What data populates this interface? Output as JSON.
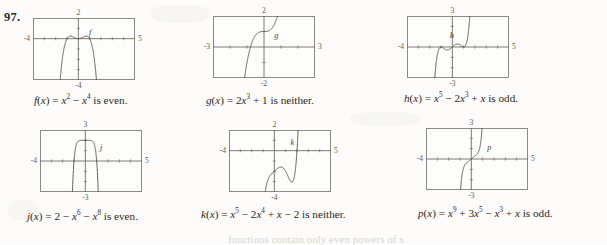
{
  "problem": {
    "number": "97."
  },
  "footer": {
    "text": "functions contain only even powers of x"
  },
  "graphs": [
    {
      "id": "graph-f",
      "curve_label": "f",
      "caption_html": "<i>f</i>(<i>x</i>) = <i>x</i><sup>2</sup> &minus; <i>x</i><sup>4</sup> is even.",
      "caption_text": "f(x) = x2 - x4 is even.",
      "window": {
        "xmin": -4,
        "xmax": 5,
        "ymin": -4,
        "ymax": 2
      },
      "labels": {
        "top": "2",
        "bottom": "-4",
        "left": "-4",
        "right": "5"
      },
      "expression": "x^2 - x^4",
      "parity": "even"
    },
    {
      "id": "graph-g",
      "curve_label": "g",
      "caption_html": "<i>g</i>(<i>x</i>) = 2<i>x</i><sup>3</sup> + 1 is neither.",
      "caption_text": "g(x) = 2x3 + 1 is neither.",
      "window": {
        "xmin": -3,
        "xmax": 3,
        "ymin": -2,
        "ymax": 2
      },
      "labels": {
        "top": "2",
        "bottom": "-2",
        "left": "-3",
        "right": "3"
      },
      "expression": "2x^3 + 1",
      "parity": "neither"
    },
    {
      "id": "graph-h",
      "curve_label": "h",
      "caption_html": "<i>h</i>(<i>x</i>) = <i>x</i><sup>5</sup> &minus; 2<i>x</i><sup>3</sup> + <i>x</i> is odd.",
      "caption_text": "h(x) = x5 - 2x3 + x is odd.",
      "window": {
        "xmin": -4,
        "xmax": 5,
        "ymin": -3,
        "ymax": 3
      },
      "labels": {
        "top": "3",
        "bottom": "-3",
        "left": "-4",
        "right": "5"
      },
      "expression": "x^5 - 2x^3 + x",
      "parity": "odd"
    },
    {
      "id": "graph-j",
      "curve_label": "j",
      "caption_html": "<i>j</i>(<i>x</i>) = 2 &minus; <i>x</i><sup>6</sup> &minus; <i>x</i><sup>8</sup> is even.",
      "caption_text": "j(x) = 2 - x6 - x8 is even.",
      "window": {
        "xmin": -4,
        "xmax": 5,
        "ymin": -3,
        "ymax": 3
      },
      "labels": {
        "top": "3",
        "bottom": "-3",
        "left": "-4",
        "right": "5"
      },
      "expression": "2 - x^6 - x^8",
      "parity": "even"
    },
    {
      "id": "graph-k",
      "curve_label": "k",
      "caption_html": "<i>k</i>(<i>x</i>) = <i>x</i><sup>5</sup> &minus; 2<i>x</i><sup>4</sup> + <i>x</i> &minus; 2 is neither.",
      "caption_text": "k(x) = x5 - 2x4 + x - 2 is neither.",
      "window": {
        "xmin": -4,
        "xmax": 5,
        "ymin": -4,
        "ymax": 2
      },
      "labels": {
        "top": "2",
        "bottom": "-4",
        "left": "-4",
        "right": "5"
      },
      "expression": "x^5 - 2x^4 + x - 2",
      "parity": "neither"
    },
    {
      "id": "graph-p",
      "curve_label": "p",
      "caption_html": "<i>p</i>(<i>x</i>) = <i>x</i><sup>9</sup> + 3<i>x</i><sup>5</sup> &minus; <i>x</i><sup>3</sup> + <i>x</i> is odd.",
      "caption_text": "p(x) = x9 + 3x5 - x3 + x is odd.",
      "window": {
        "xmin": -4,
        "xmax": 5,
        "ymin": -3,
        "ymax": 3
      },
      "labels": {
        "top": "3",
        "bottom": "-3",
        "left": "-4",
        "right": "5"
      },
      "expression": "x^9 + 3x^5 - x^3 + x",
      "parity": "odd"
    }
  ],
  "chart_data": [
    {
      "type": "line",
      "title": "f(x) = x^2 - x^4 is even.",
      "xlabel": "x",
      "ylabel": "y",
      "xlim": [
        -4,
        5
      ],
      "ylim": [
        -4,
        2
      ],
      "grid": false,
      "series": [
        {
          "name": "f",
          "expression": "x^2 - x^4"
        }
      ],
      "ticks": {
        "x": [
          -4,
          5
        ],
        "y": [
          -4,
          2
        ]
      }
    },
    {
      "type": "line",
      "title": "g(x) = 2x^3 + 1 is neither.",
      "xlabel": "x",
      "ylabel": "y",
      "xlim": [
        -3,
        3
      ],
      "ylim": [
        -2,
        2
      ],
      "grid": false,
      "series": [
        {
          "name": "g",
          "expression": "2x^3 + 1"
        }
      ],
      "ticks": {
        "x": [
          -3,
          3
        ],
        "y": [
          -2,
          2
        ]
      }
    },
    {
      "type": "line",
      "title": "h(x) = x^5 - 2x^3 + x is odd.",
      "xlabel": "x",
      "ylabel": "y",
      "xlim": [
        -4,
        5
      ],
      "ylim": [
        -3,
        3
      ],
      "grid": false,
      "series": [
        {
          "name": "h",
          "expression": "x^5 - 2x^3 + x"
        }
      ],
      "ticks": {
        "x": [
          -4,
          5
        ],
        "y": [
          -3,
          3
        ]
      }
    },
    {
      "type": "line",
      "title": "j(x) = 2 - x^6 - x^8 is even.",
      "xlabel": "x",
      "ylabel": "y",
      "xlim": [
        -4,
        5
      ],
      "ylim": [
        -3,
        3
      ],
      "grid": false,
      "series": [
        {
          "name": "j",
          "expression": "2 - x^6 - x^8"
        }
      ],
      "ticks": {
        "x": [
          -4,
          5
        ],
        "y": [
          -3,
          3
        ]
      }
    },
    {
      "type": "line",
      "title": "k(x) = x^5 - 2x^4 + x - 2 is neither.",
      "xlabel": "x",
      "ylabel": "y",
      "xlim": [
        -4,
        5
      ],
      "ylim": [
        -4,
        2
      ],
      "grid": false,
      "series": [
        {
          "name": "k",
          "expression": "x^5 - 2x^4 + x - 2"
        }
      ],
      "ticks": {
        "x": [
          -4,
          5
        ],
        "y": [
          -4,
          2
        ]
      }
    },
    {
      "type": "line",
      "title": "p(x) = x^9 + 3x^5 - x^3 + x is odd.",
      "xlabel": "x",
      "ylabel": "y",
      "xlim": [
        -4,
        5
      ],
      "ylim": [
        -3,
        3
      ],
      "grid": false,
      "series": [
        {
          "name": "p",
          "expression": "x^9 + 3x^5 - x^3 + x"
        }
      ],
      "ticks": {
        "x": [
          -4,
          5
        ],
        "y": [
          -3,
          3
        ]
      }
    }
  ],
  "layout": {
    "cells": [
      {
        "left": 33,
        "top": 18,
        "w": 102,
        "h": 62,
        "caption_left": 34,
        "caption_top": 95,
        "name_x": 0.56,
        "name_y": 0.22
      },
      {
        "left": 213,
        "top": 16,
        "w": 102,
        "h": 62,
        "caption_left": 206,
        "caption_top": 95,
        "name_x": 0.62,
        "name_y": 0.3
      },
      {
        "left": 407,
        "top": 16,
        "w": 102,
        "h": 62,
        "caption_left": 404,
        "caption_top": 93,
        "name_x": 0.44,
        "name_y": 0.3
      },
      {
        "left": 40,
        "top": 130,
        "w": 102,
        "h": 62,
        "caption_left": 27,
        "caption_top": 211,
        "name_x": 0.6,
        "name_y": 0.28
      },
      {
        "left": 229,
        "top": 130,
        "w": 102,
        "h": 62,
        "caption_left": 201,
        "caption_top": 209,
        "name_x": 0.62,
        "name_y": 0.2
      },
      {
        "left": 426,
        "top": 128,
        "w": 102,
        "h": 62,
        "caption_left": 418,
        "caption_top": 208,
        "name_x": 0.62,
        "name_y": 0.3
      }
    ]
  }
}
